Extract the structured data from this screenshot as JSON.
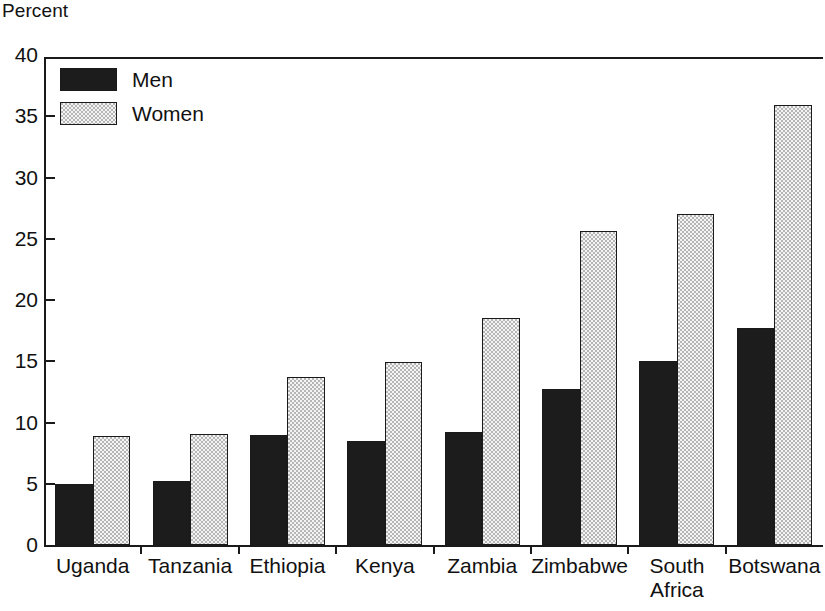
{
  "chart_data": {
    "type": "bar",
    "title": "",
    "subtitle": "",
    "ylabel": "Percent",
    "xlabel": "",
    "ylim": [
      0,
      40
    ],
    "yticks": [
      0,
      5,
      10,
      15,
      20,
      25,
      30,
      35,
      40
    ],
    "ytick_labels": [
      "0",
      "5",
      "10",
      "15",
      "20",
      "25",
      "30",
      "35",
      "40"
    ],
    "grid": false,
    "legend_position": "top-left",
    "categories": [
      "Uganda",
      "Tanzania",
      "Ethiopia",
      "Kenya",
      "Zambia",
      "Zimbabwe",
      "South\nAfrica",
      "Botswana"
    ],
    "series": [
      {
        "name": "Men",
        "color": "#1c1c1c",
        "fill": "solid-black",
        "values": [
          5.0,
          5.2,
          9.0,
          8.5,
          9.2,
          12.7,
          15.0,
          17.7
        ]
      },
      {
        "name": "Women",
        "color": "#b6b6b6",
        "fill": "gray-stipple",
        "values": [
          8.9,
          9.1,
          13.7,
          14.9,
          18.5,
          25.6,
          27.0,
          35.9
        ]
      }
    ]
  },
  "legend": {
    "items": [
      {
        "label": "Men",
        "style": "men"
      },
      {
        "label": "Women",
        "style": "women"
      }
    ]
  }
}
